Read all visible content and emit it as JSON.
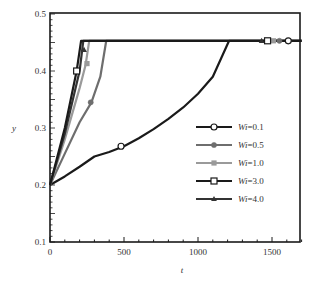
{
  "chart_data": {
    "type": "line",
    "title": "",
    "xlabel": "t",
    "ylabel": "y",
    "xlim": [
      0,
      1700
    ],
    "ylim": [
      0.1,
      0.5
    ],
    "xticks": [
      0,
      500,
      1000,
      1500
    ],
    "xtick_labels": [
      "0",
      "500",
      "1000",
      "1500"
    ],
    "yticks": [
      0.1,
      0.2,
      0.3,
      0.4,
      0.5
    ],
    "ytick_labels": [
      "0.1",
      "0.2",
      "0.3",
      "0.4",
      "0.5"
    ],
    "grid": false,
    "legend_position": "center-right",
    "series": [
      {
        "name": "Wi=0.1",
        "color": "#1a1a1a",
        "marker": "open-circle",
        "x": [
          0,
          100,
          200,
          300,
          400,
          500,
          600,
          700,
          800,
          900,
          1000,
          1100,
          1210,
          1700
        ],
        "y": [
          0.2,
          0.215,
          0.232,
          0.25,
          0.258,
          0.268,
          0.282,
          0.298,
          0.316,
          0.336,
          0.36,
          0.39,
          0.453,
          0.453
        ],
        "marker_points": [
          [
            480,
            0.268
          ],
          [
            1610,
            0.453
          ]
        ]
      },
      {
        "name": "Wi=0.5",
        "color": "#6e6e6e",
        "marker": "filled-circle",
        "x": [
          0,
          100,
          200,
          280,
          340,
          380,
          1700
        ],
        "y": [
          0.2,
          0.255,
          0.31,
          0.345,
          0.39,
          0.453,
          0.453
        ],
        "marker_points": [
          [
            275,
            0.345
          ],
          [
            1550,
            0.453
          ]
        ]
      },
      {
        "name": "Wi=1.0",
        "color": "#9a9a9a",
        "marker": "filled-square",
        "x": [
          0,
          100,
          200,
          240,
          265,
          1700
        ],
        "y": [
          0.2,
          0.28,
          0.37,
          0.41,
          0.453,
          0.453
        ],
        "marker_points": [
          [
            250,
            0.413
          ],
          [
            1510,
            0.453
          ]
        ]
      },
      {
        "name": "Wi=3.0",
        "color": "#1a1a1a",
        "marker": "open-square",
        "x": [
          0,
          100,
          180,
          210,
          1700
        ],
        "y": [
          0.2,
          0.3,
          0.4,
          0.453,
          0.453
        ],
        "marker_points": [
          [
            180,
            0.4
          ],
          [
            1470,
            0.453
          ]
        ]
      },
      {
        "name": "Wi=4.0",
        "color": "#333333",
        "marker": "filled-triangle",
        "x": [
          0,
          100,
          200,
          225,
          1700
        ],
        "y": [
          0.2,
          0.29,
          0.4,
          0.453,
          0.453
        ],
        "marker_points": [
          [
            230,
            0.437
          ],
          [
            1430,
            0.453
          ]
        ]
      }
    ],
    "legend": {
      "entries": [
        {
          "prefix": "Wi",
          "suffix": "=0.1"
        },
        {
          "prefix": "Wi",
          "suffix": "=0.5"
        },
        {
          "prefix": "Wi",
          "suffix": "=1.0"
        },
        {
          "prefix": "Wi",
          "suffix": "=3.0"
        },
        {
          "prefix": "Wi",
          "suffix": "=4.0"
        }
      ]
    }
  }
}
